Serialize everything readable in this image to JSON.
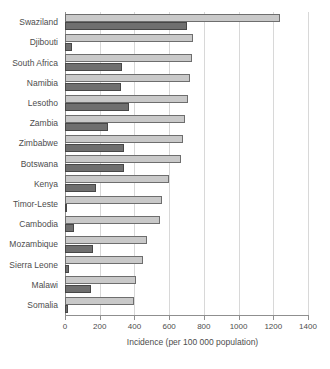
{
  "chart_data": {
    "type": "bar",
    "orientation": "horizontal",
    "title": "",
    "xlabel": "Incidence (per 100 000 population)",
    "ylabel": "",
    "xlim": [
      0,
      1400
    ],
    "xticks": [
      0,
      200,
      400,
      600,
      800,
      1000,
      1200,
      1400
    ],
    "xtick_labels": [
      "0",
      "200",
      "400",
      "600",
      "800",
      "1000",
      "1200",
      "1400"
    ],
    "grid": true,
    "legend": "none",
    "categories": [
      "Swaziland",
      "Djibouti",
      "South Africa",
      "Namibia",
      "Lesotho",
      "Zambia",
      "Zimbabwe",
      "Botswana",
      "Kenya",
      "Timor-Leste",
      "Cambodia",
      "Mozambique",
      "Sierra Leone",
      "Malawi",
      "Somalia"
    ],
    "series": [
      {
        "name": "light-bar",
        "color": "#c9c9c9",
        "values": [
          1240,
          740,
          730,
          720,
          710,
          690,
          680,
          670,
          600,
          560,
          550,
          470,
          450,
          410,
          400
        ]
      },
      {
        "name": "dark-bar",
        "color": "#6f6f6f",
        "values": [
          700,
          40,
          330,
          320,
          370,
          250,
          340,
          340,
          180,
          10,
          50,
          160,
          25,
          150,
          20
        ]
      }
    ]
  },
  "axis": {
    "x_title": "Incidence (per 100 000 population)"
  }
}
